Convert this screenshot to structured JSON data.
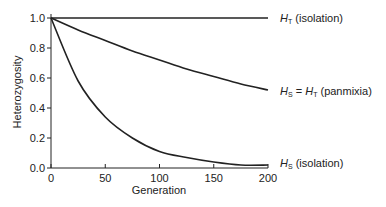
{
  "chart_data": {
    "type": "line",
    "title": "",
    "xlabel": "Generation",
    "ylabel": "Heterozygosity",
    "xlim": [
      0,
      200
    ],
    "ylim": [
      0.0,
      1.0
    ],
    "xticks": [
      "0",
      "50",
      "100",
      "150",
      "200"
    ],
    "yticks": [
      "0.0",
      "0.2",
      "0.4",
      "0.6",
      "0.8",
      "1.0"
    ],
    "grid": false,
    "legend": "inline labels at right end of each curve",
    "x": [
      0,
      25,
      50,
      75,
      100,
      125,
      150,
      175,
      200
    ],
    "series": [
      {
        "name": "H_T (isolation)",
        "label_main": "H",
        "label_sub": "T",
        "label_rest": " (isolation)",
        "values": [
          1.0,
          1.0,
          1.0,
          1.0,
          1.0,
          1.0,
          1.0,
          1.0,
          1.0
        ]
      },
      {
        "name": "H_S = H_T (panmixia)",
        "label_main": "H",
        "label_sub": "S",
        "label_mid": " = ",
        "label_main2": "H",
        "label_sub2": "T",
        "label_rest": " (panmixia)",
        "values": [
          1.0,
          0.92,
          0.85,
          0.78,
          0.72,
          0.66,
          0.61,
          0.56,
          0.52
        ]
      },
      {
        "name": "H_S (isolation)",
        "label_main": "H",
        "label_sub": "S",
        "label_rest": " (isolation)",
        "values": [
          1.0,
          0.58,
          0.34,
          0.2,
          0.11,
          0.07,
          0.04,
          0.02,
          0.02
        ]
      }
    ]
  }
}
